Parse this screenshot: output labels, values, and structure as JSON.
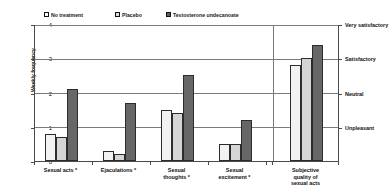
{
  "chart_data": {
    "type": "bar",
    "title": "",
    "xlabel": "",
    "ylabel": "Weekly frequency",
    "ylim": [
      0,
      4
    ],
    "yticks": [
      0,
      1,
      2,
      3,
      4
    ],
    "ytick_labels": [
      "0",
      "1",
      "2",
      "3",
      "4"
    ],
    "grid": true,
    "grid_axis": "y",
    "legend_position": "top",
    "categories": [
      "Sexual acts *",
      "Ejaculations *",
      "Sexual thoughts *",
      "Sexual excitement *",
      "Subjective quality of sexual acts"
    ],
    "series": [
      {
        "name": "No treatment",
        "color": "#f2f2f2",
        "values": [
          0.8,
          0.3,
          1.5,
          0.5,
          2.8
        ]
      },
      {
        "name": "Placebo",
        "color": "#d5d5d5",
        "values": [
          0.7,
          0.2,
          1.4,
          0.5,
          3.0
        ]
      },
      {
        "name": "Testosterone undecanoate",
        "color": "#676767",
        "values": [
          2.1,
          1.7,
          2.5,
          1.2,
          3.4
        ]
      }
    ],
    "secondary_axis": {
      "label": "",
      "ticks": [
        4,
        3,
        2,
        1
      ],
      "tick_labels": [
        "Very satisfactory",
        "Satisfactory",
        "Neutral",
        "Unpleasant"
      ]
    },
    "annotations": {
      "divider_note": "vertical separator between frequency groups and subjective quality group"
    }
  },
  "legend": {
    "items": [
      {
        "label": "No treatment",
        "swatch": "no-treatment-swatch"
      },
      {
        "label": "Placebo",
        "swatch": "placebo-swatch"
      },
      {
        "label": "Testosterone undecanoate",
        "swatch": "testosterone-swatch"
      }
    ]
  },
  "axes": {
    "y_title": "Weekly frequency",
    "y_ticks": [
      "4",
      "3",
      "2",
      "1",
      "0"
    ],
    "right_ticks": [
      "Very satisfactory",
      "Satisfactory",
      "Neutral",
      "Unpleasant"
    ]
  },
  "categories": [
    {
      "line1": "Sexual acts *",
      "line2": "",
      "line3": ""
    },
    {
      "line1": "Ejaculations *",
      "line2": "",
      "line3": ""
    },
    {
      "line1": "Sexual",
      "line2": "thoughts *",
      "line3": ""
    },
    {
      "line1": "Sexual",
      "line2": "excitement *",
      "line3": ""
    },
    {
      "line1": "Subjective",
      "line2": "quality of",
      "line3": "sexual acts"
    }
  ]
}
